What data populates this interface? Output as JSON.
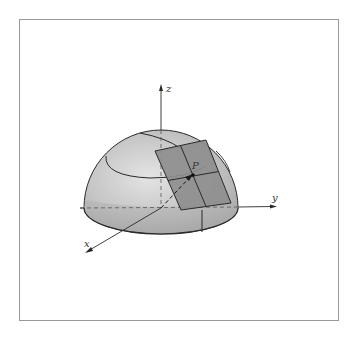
{
  "figure": {
    "axes": {
      "x_label": "x",
      "y_label": "y",
      "z_label": "z"
    },
    "point_label": "P",
    "colors": {
      "frame_border": "#9a9a9a",
      "hemisphere_light": "#d9d9d9",
      "hemisphere_mid": "#b8b8b8",
      "hemisphere_dark": "#9c9c9c",
      "tangent_plane": "#8c8c8c",
      "lines": "#2a2a2a"
    }
  }
}
